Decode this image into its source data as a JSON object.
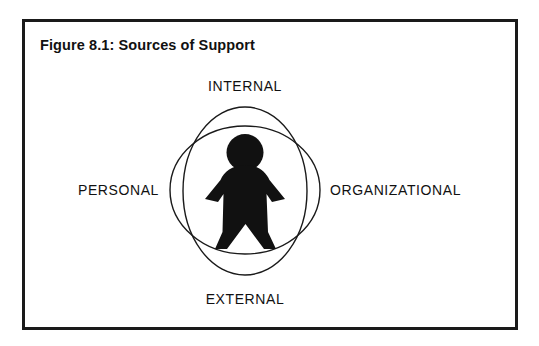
{
  "figure": {
    "title": "Figure 8.1: Sources of Support",
    "border_color": "#1a1a1a",
    "background_color": "#ffffff"
  },
  "diagram": {
    "type": "venn-overlapping-ellipses",
    "center_figure": "person-silhouette",
    "center_figure_color": "#111111",
    "stroke_color": "#1a1a1a",
    "labels": {
      "top": "INTERNAL",
      "bottom": "EXTERNAL",
      "left": "PERSONAL",
      "right": "ORGANIZATIONAL"
    },
    "ellipses": [
      {
        "name": "horizontal-ellipse",
        "cx": 245,
        "cy": 190,
        "rx": 75,
        "ry": 64
      },
      {
        "name": "vertical-ellipse",
        "cx": 245,
        "cy": 191,
        "rx": 62,
        "ry": 84
      }
    ]
  }
}
